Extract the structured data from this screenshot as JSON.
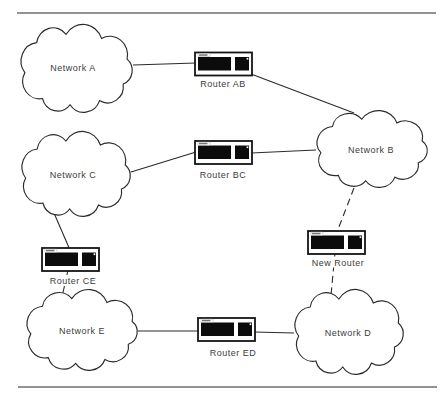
{
  "figure": {
    "colors": {
      "background": "#ffffff",
      "line": "#2b2b2b",
      "rule": "#6e6e6e",
      "router_fill": "#0c0c0c",
      "text": "#3c3c3c"
    }
  },
  "networks": [
    {
      "id": "network-a",
      "label": "Network A"
    },
    {
      "id": "network-b",
      "label": "Network B"
    },
    {
      "id": "network-c",
      "label": "Network C"
    },
    {
      "id": "network-d",
      "label": "Network D"
    },
    {
      "id": "network-e",
      "label": "Network E"
    }
  ],
  "routers": [
    {
      "id": "router-ab",
      "label": "Router AB"
    },
    {
      "id": "router-bc",
      "label": "Router BC"
    },
    {
      "id": "router-ce",
      "label": "Router CE"
    },
    {
      "id": "router-ed",
      "label": "Router ED"
    },
    {
      "id": "new-router",
      "label": "New Router"
    }
  ],
  "connections": [
    {
      "from": "Network A",
      "to": "Router AB",
      "style": "solid"
    },
    {
      "from": "Router AB",
      "to": "Network B",
      "style": "solid"
    },
    {
      "from": "Network C",
      "to": "Router BC",
      "style": "solid"
    },
    {
      "from": "Router BC",
      "to": "Network B",
      "style": "solid"
    },
    {
      "from": "Network C",
      "to": "Router CE",
      "style": "solid"
    },
    {
      "from": "Router CE",
      "to": "Network E",
      "style": "solid"
    },
    {
      "from": "Network E",
      "to": "Router ED",
      "style": "solid"
    },
    {
      "from": "Router ED",
      "to": "Network D",
      "style": "solid"
    },
    {
      "from": "Network B",
      "to": "New Router",
      "style": "dashed"
    },
    {
      "from": "New Router",
      "to": "Network D",
      "style": "dashed"
    }
  ],
  "icons": {
    "cloud": "network-cloud-icon",
    "router": "router-device-icon"
  }
}
